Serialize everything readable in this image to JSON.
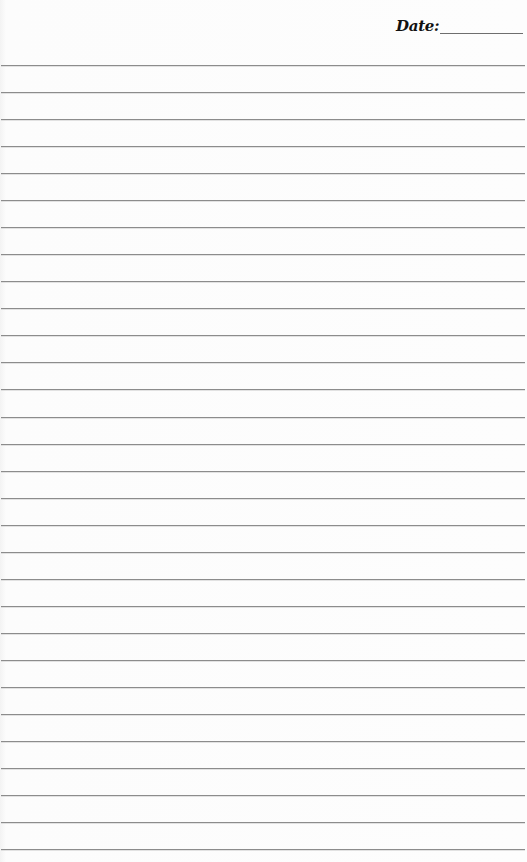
{
  "page": {
    "type": "lined-notepaper",
    "header": {
      "date_label": "Date:",
      "date_value": ""
    },
    "rules": {
      "count": 30,
      "first_y": 65,
      "spacing": 27.04,
      "color": "#8c8c8c"
    },
    "background_color": "#fbfbfb"
  }
}
